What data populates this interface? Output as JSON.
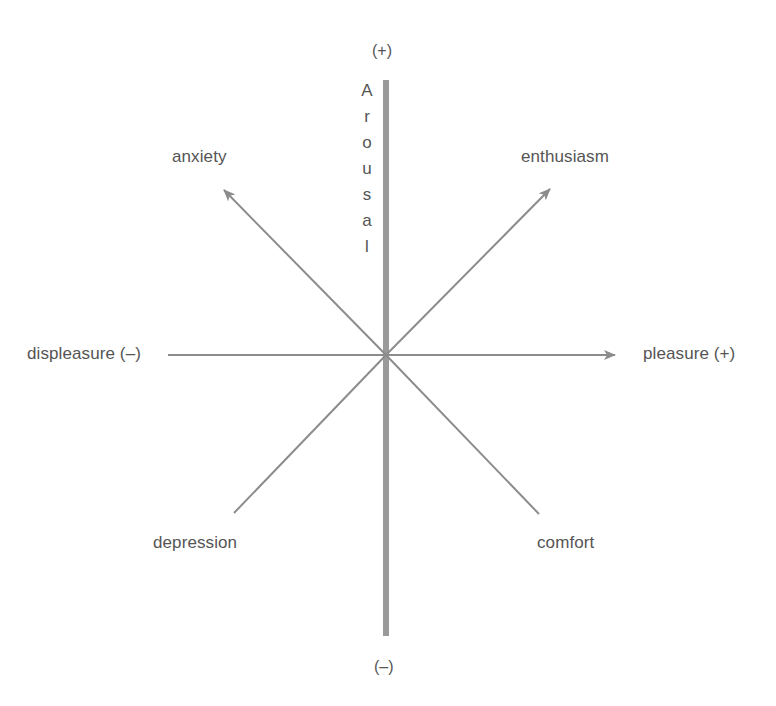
{
  "diagram": {
    "vertical_axis": {
      "label": "Arousal",
      "letters": [
        "A",
        "r",
        "o",
        "u",
        "s",
        "a",
        "l"
      ],
      "top_sign": "(+)",
      "bottom_sign": "(–)"
    },
    "horizontal_axis": {
      "left_label": "displeasure (–)",
      "right_label": "pleasure (+)"
    },
    "diagonals": {
      "upper_left": "anxiety",
      "upper_right": "enthusiasm",
      "lower_left": "depression",
      "lower_right": "comfort"
    },
    "colors": {
      "axis_bar": "#9a9a9a",
      "arrows": "#8c8c8c",
      "text": "#555555"
    }
  }
}
